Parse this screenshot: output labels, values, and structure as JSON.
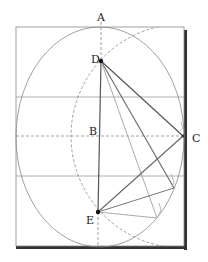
{
  "diagram": {
    "type": "geometric-construction",
    "labels": {
      "A": "A",
      "B": "B",
      "C": "C",
      "D": "D",
      "E": "E"
    },
    "points": {
      "A": [
        101,
        27
      ],
      "B": [
        101,
        136
      ],
      "C": [
        183,
        136
      ],
      "D": [
        101,
        61
      ],
      "E": [
        98,
        212
      ]
    },
    "colors": {
      "line_dark": "#555555",
      "line_light": "#9a9a9a",
      "frame": "#777777",
      "shadow": "#333333",
      "dashed": "#888888"
    }
  }
}
